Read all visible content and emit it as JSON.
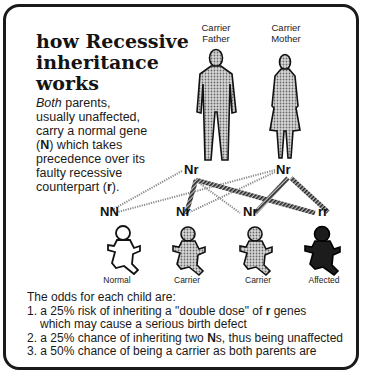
{
  "title": {
    "line1": "how Recessive",
    "line2": "inheritance",
    "line3": "works"
  },
  "intro": {
    "emph": "Both",
    "line1_rest": " parents,",
    "line2": "usually unaffected,",
    "line3": "carry a normal gene",
    "gene_normal": "N",
    "line4_rest": " which takes",
    "line5": "precedence over its",
    "line6": "faulty recessive",
    "line7_pre": "counterpart (",
    "gene_recessive": "r",
    "line7_post": ")."
  },
  "parents": [
    {
      "label_line1": "Carrier",
      "label_line2": "Father",
      "genotype": "Nr"
    },
    {
      "label_line1": "Carrier",
      "label_line2": "Mother",
      "genotype": "Nr"
    }
  ],
  "children": [
    {
      "genotype": "NN",
      "label": "Normal"
    },
    {
      "genotype": "Nr",
      "label": "Carrier"
    },
    {
      "genotype": "Nr",
      "label": "Carrier"
    },
    {
      "genotype": "rr",
      "label": "Affected"
    }
  ],
  "odds": {
    "heading": "The odds for each child are:",
    "item1_a": "1. a 25% risk of inheriting a \"double dose\" of ",
    "item1_gene": "r",
    "item1_b": " genes",
    "item1_c": "which may cause a serious birth defect",
    "item2_a": "2. a 25% chance of inheriting two ",
    "item2_gene": "N",
    "item2_b": "s, thus being unaffected",
    "item3": "3. a 50% chance of being a carrier as both parents are"
  },
  "colors": {
    "border": "#1a1a1a",
    "stipple": "#9a9a9a",
    "affected": "#1c1c1c"
  }
}
